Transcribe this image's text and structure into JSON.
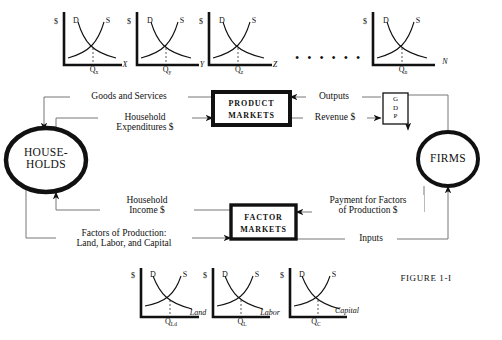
{
  "figure": {
    "caption": "FIGURE 1-I"
  },
  "nodes": {
    "households": {
      "line1": "HOUSE-",
      "line2": "HOLDS"
    },
    "firms": {
      "label": "FIRMS"
    },
    "product_markets": {
      "line1": "PRODUCT",
      "line2": "MARKETS"
    },
    "factor_markets": {
      "line1": "FACTOR",
      "line2": "MARKETS"
    },
    "gdp": {
      "letters": [
        "G",
        "D",
        "P"
      ]
    }
  },
  "flows": {
    "goods_and_services": {
      "label": "Goods and Services"
    },
    "household_expenditures": {
      "line1": "Household",
      "line2": "Expenditures $"
    },
    "outputs": {
      "label": "Outputs"
    },
    "revenue": {
      "label": "Revenue $"
    },
    "household_income": {
      "line1": "Household",
      "line2": "Income $"
    },
    "factors_of_production": {
      "line1": "Factors of Production:",
      "line2": "Land, Labor, and Capital"
    },
    "payment_for_factors": {
      "line1": "Payment for Factors",
      "line2": "of Production $"
    },
    "inputs": {
      "label": "Inputs"
    }
  },
  "separator": {
    "dots": "• • • • • •"
  },
  "charts": {
    "axis_price": "$",
    "demand": "D",
    "supply": "S",
    "top": [
      {
        "q": "Q",
        "sub": "x",
        "market": "X"
      },
      {
        "q": "Q",
        "sub": "y",
        "market": "Y"
      },
      {
        "q": "Q",
        "sub": "z",
        "market": "Z"
      },
      {
        "q": "Q",
        "sub": "n",
        "market": "N"
      }
    ],
    "bottom": [
      {
        "q": "Q",
        "sub": "Ld",
        "market": "Land"
      },
      {
        "q": "Q",
        "sub": "L",
        "market": "Labor"
      },
      {
        "q": "Q",
        "sub": "C",
        "market": "Capital"
      }
    ]
  },
  "colors": {
    "ink": "#111111",
    "line": "#777777",
    "background": "#ffffff"
  }
}
